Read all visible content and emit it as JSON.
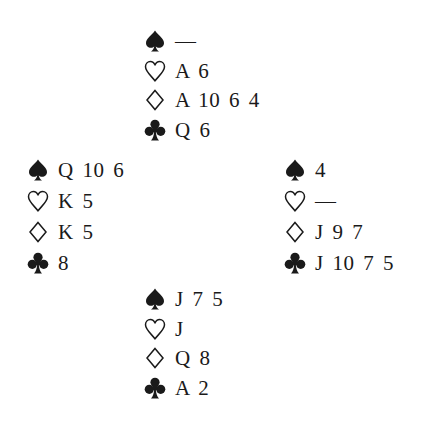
{
  "diagram": {
    "type": "bridge-deal",
    "hands": {
      "north": {
        "spades": "—",
        "hearts": "A 6",
        "diamonds": "A 10 6 4",
        "clubs": "Q 6"
      },
      "west": {
        "spades": "Q 10 6",
        "hearts": "K 5",
        "diamonds": "K 5",
        "clubs": "8"
      },
      "east": {
        "spades": "4",
        "hearts": "—",
        "diamonds": "J 9 7",
        "clubs": "J 10 7 5"
      },
      "south": {
        "spades": "J 7 5",
        "hearts": "J",
        "diamonds": "Q 8",
        "clubs": "A 2"
      }
    },
    "suit_icons": {
      "spades": "spade-icon (filled)",
      "hearts": "heart-icon (outline)",
      "diamonds": "diamond-icon (outline)",
      "clubs": "club-icon (filled)"
    },
    "colors": {
      "ink": "#1a1a1a",
      "background": "#ffffff"
    }
  }
}
